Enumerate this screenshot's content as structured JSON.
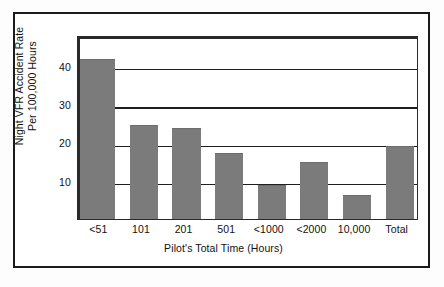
{
  "chart_data": {
    "type": "bar",
    "title": "",
    "xlabel": "Pilot's Total Time (Hours)",
    "ylabel": "Night VFR Accident Rate Per 100,000 Hours",
    "ylabel_lines": [
      "Night VFR Accident Rate",
      "Per 100,000 Hours"
    ],
    "categories": [
      "<51",
      "101",
      "201",
      "501",
      "<1000",
      "<2000",
      "10,000",
      "Total"
    ],
    "values": [
      41.5,
      24.2,
      23.5,
      17.0,
      8.7,
      14.5,
      6.0,
      18.7
    ],
    "series": [
      {
        "name": "Night VFR Accident Rate",
        "values": [
          41.5,
          24.2,
          23.5,
          17.0,
          8.7,
          14.5,
          6.0,
          18.7
        ]
      }
    ],
    "yticks": [
      10,
      20,
      30,
      40
    ],
    "ytick_labels": [
      "10",
      "20",
      "30",
      "40"
    ],
    "ylim": [
      0,
      48
    ],
    "xlim_note": "categorical",
    "grid": "horizontal",
    "legend": "none",
    "bar_color": "#7b7b7b",
    "axis_color": "#1f1f1f",
    "background_color": "#ffffff"
  },
  "figure": {
    "border_color": "#1b1b1b",
    "page_background": "#fdfdfd"
  }
}
